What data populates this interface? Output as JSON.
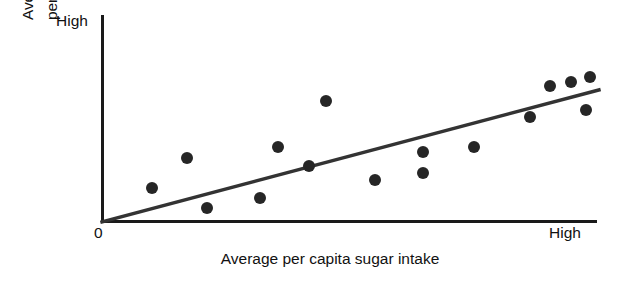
{
  "axes": {
    "y_axis_top_label": "High",
    "y_axis_origin_label": "0",
    "x_axis_right_label": "High",
    "x_axis_title": "Average per capita sugar intake",
    "y_axis_title_line1": "Average no. of caries",
    "y_axis_title_line2": "per person per yr",
    "ink_color": "#1a1a1a",
    "point_color": "#262626"
  },
  "chart_data": {
    "type": "scatter",
    "title": "",
    "xlabel": "Average per capita sugar intake",
    "ylabel": "Average no. of caries per person per yr",
    "xlim": [
      0,
      100
    ],
    "ylim": [
      0,
      100
    ],
    "xticklabels": [
      "0",
      "High"
    ],
    "yticklabels": [
      "0",
      "High"
    ],
    "grid": false,
    "legend": false,
    "points": [
      {
        "x": 10.1,
        "y": 16.4
      },
      {
        "x": 17.2,
        "y": 30.9
      },
      {
        "x": 21.3,
        "y": 6.8
      },
      {
        "x": 31.9,
        "y": 11.6
      },
      {
        "x": 35.6,
        "y": 36.2
      },
      {
        "x": 41.9,
        "y": 27.1
      },
      {
        "x": 45.3,
        "y": 58.5
      },
      {
        "x": 55.3,
        "y": 20.3
      },
      {
        "x": 65.0,
        "y": 33.8
      },
      {
        "x": 65.0,
        "y": 23.7
      },
      {
        "x": 75.3,
        "y": 36.2
      },
      {
        "x": 86.6,
        "y": 50.7
      },
      {
        "x": 90.7,
        "y": 65.7
      },
      {
        "x": 94.9,
        "y": 67.6
      },
      {
        "x": 98.8,
        "y": 70.0
      },
      {
        "x": 98.0,
        "y": 54.1
      }
    ],
    "trendline": {
      "kind": "linear-fit",
      "x_start": 0,
      "y_start": 0,
      "x_end": 100.6,
      "y_end": 63.8
    }
  }
}
